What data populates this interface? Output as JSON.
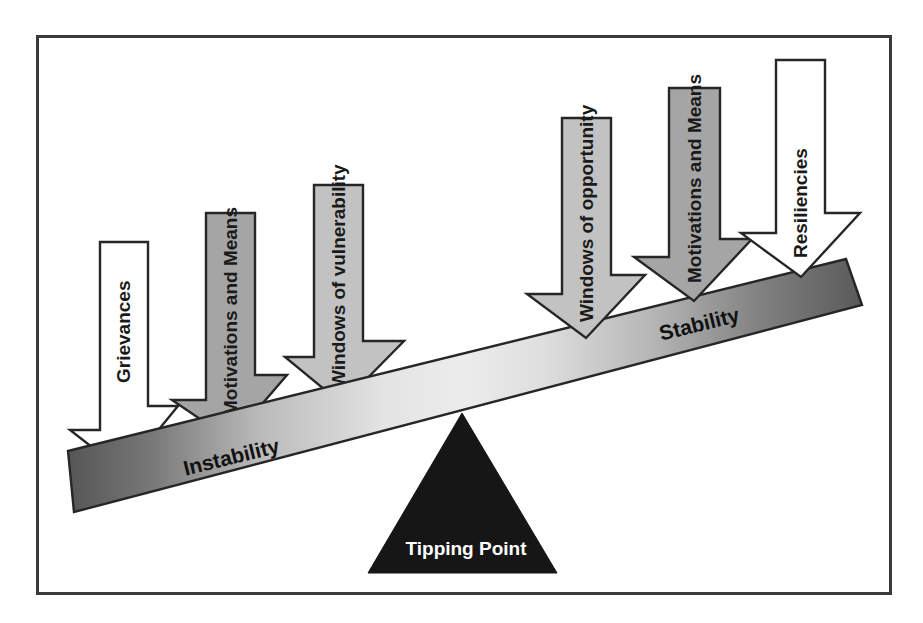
{
  "figure": {
    "frame": {
      "border_color": "#3a3a3a"
    },
    "colors": {
      "beam_left_dark": "#595959",
      "beam_mid_light": "#e8e8e8",
      "beam_right_dark": "#5e5e5e",
      "arrow_white": "#ffffff",
      "arrow_gray": "#a5a5a5",
      "arrow_light_gray": "#c2c2c2",
      "fulcrum": "#161616",
      "outline": "#262626",
      "label_dark": "#111111",
      "label_light": "#ffffff"
    }
  },
  "beam": {
    "labels": {
      "left": "Instability",
      "right": "Stability"
    }
  },
  "fulcrum": {
    "label": "Tipping Point"
  },
  "arrows": [
    {
      "id": "grievances",
      "label": "Grievances",
      "side": "instability",
      "fill": "#ffffff"
    },
    {
      "id": "motivations-means-left",
      "label": "Motivations and Means",
      "side": "instability",
      "fill": "#a5a5a5"
    },
    {
      "id": "windows-vulnerability",
      "label": "Windows of vulnerability",
      "side": "instability",
      "fill": "#c2c2c2"
    },
    {
      "id": "windows-opportunity",
      "label": "Windows of opportunity",
      "side": "stability",
      "fill": "#c2c2c2"
    },
    {
      "id": "motivations-means-right",
      "label": "Motivations and Means",
      "side": "stability",
      "fill": "#a5a5a5"
    },
    {
      "id": "resiliencies",
      "label": "Resiliencies",
      "side": "stability",
      "fill": "#ffffff"
    }
  ]
}
